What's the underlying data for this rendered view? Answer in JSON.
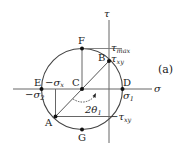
{
  "figure": {
    "panel_label": "(a)"
  },
  "axes": {
    "sigma_label": "σ",
    "tau_label": "τ"
  },
  "points": {
    "A": "A",
    "B": "B",
    "C": "C",
    "D": "D",
    "E": "E",
    "F": "F",
    "G": "G"
  },
  "annotations": {
    "tau_max": "τ",
    "tau_max_sub": "max",
    "tau_xy": "τ",
    "tau_xy_sub": "xy",
    "neg_tau_xy": "−τ",
    "neg_tau_xy_sub": "xy",
    "neg_sigma_x": "−σ",
    "neg_sigma_x_sub": "x",
    "neg_sigma_2": "−σ",
    "neg_sigma_2_sub": "2",
    "sigma_1": "σ",
    "sigma_1_sub": "1",
    "angle": "2θ",
    "angle_sub": "1"
  },
  "colors": {
    "line": "#555555",
    "point": "#111111",
    "text": "#222222"
  }
}
